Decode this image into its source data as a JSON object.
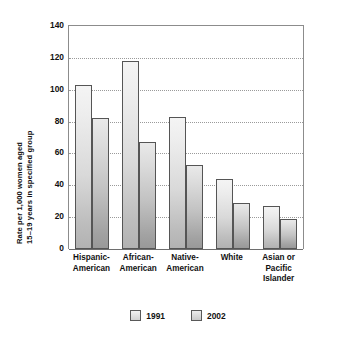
{
  "chart_data": {
    "type": "bar",
    "title": "",
    "xlabel": "",
    "ylabel": "Rate per 1,000 women aged 15–19 years in specified group",
    "ylabel_line1": "Rate per 1,000 women aged",
    "ylabel_line2": "15–19 years in specified group",
    "ylim": [
      0,
      140
    ],
    "ytick_labels": [
      "140",
      "120",
      "100",
      "80",
      "60",
      "40",
      "20",
      "0"
    ],
    "ytick_values": [
      140,
      120,
      100,
      80,
      60,
      40,
      20,
      0
    ],
    "grid": true,
    "grid_style": "dotted-horizontal",
    "legend_position": "bottom-center",
    "categories": [
      "Hispanic-American",
      "African-American",
      "Native-American",
      "White",
      "Asian or Pacific Islander"
    ],
    "category_label_lines": [
      [
        "Hispanic-",
        "American"
      ],
      [
        "African-",
        "American"
      ],
      [
        "Native-",
        "American"
      ],
      [
        "White"
      ],
      [
        "Asian or",
        "Pacific",
        "Islander"
      ]
    ],
    "series": [
      {
        "name": "1991",
        "color": "#dcdcdc",
        "values": [
          103,
          118,
          83,
          44,
          27
        ]
      },
      {
        "name": "2002",
        "color": "#c4c4c4",
        "values": [
          82,
          67,
          53,
          29,
          19
        ]
      }
    ]
  }
}
